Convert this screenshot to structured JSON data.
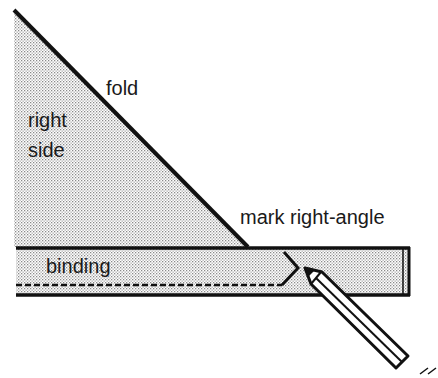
{
  "diagram": {
    "labels": {
      "fold": "fold",
      "right": "right",
      "side": "side",
      "mark": "mark right-angle",
      "binding": "binding"
    },
    "colors": {
      "line": "#111111",
      "fill_dot": "#9a9a9a",
      "background": "#ffffff"
    }
  }
}
